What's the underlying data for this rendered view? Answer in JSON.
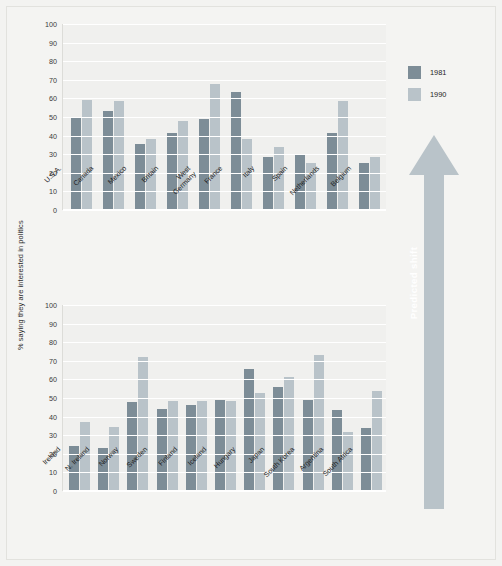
{
  "figure": {
    "ylabel": "% saying they are interested in politics",
    "annotation": "Predicted shift"
  },
  "legend": {
    "position": "top-right",
    "items": [
      {
        "label": "1981",
        "color": "#7d8d97"
      },
      {
        "label": "1990",
        "color": "#b9c3c9"
      }
    ]
  },
  "axis": {
    "ticks": [
      "100",
      "90",
      "80",
      "70",
      "60",
      "50",
      "40",
      "30",
      "20",
      "10",
      "0"
    ]
  },
  "chart_data": [
    {
      "type": "bar",
      "title": "",
      "xlabel": "",
      "ylabel": "% saying they are interested in politics",
      "ylim": [
        0,
        100
      ],
      "grid": true,
      "panel": "top",
      "categories": [
        "U.S.A.",
        "Canada",
        "Mexico",
        "Britain",
        "West\nGermany",
        "France",
        "Italy",
        "Spain",
        "Netherlands",
        "Belgium"
      ],
      "series": [
        {
          "name": "1981",
          "color": "#7d8d97",
          "values": [
            50,
            53,
            35.5,
            41.5,
            49,
            63.5,
            38.5,
            30,
            25.5,
            41.5
          ]
        },
        {
          "name": "1990",
          "color": "#b9c3c9",
          "values": [
            59,
            58.5,
            38,
            48,
            68,
            38,
            28.5,
            34,
            30.5,
            25.5
          ]
        }
      ],
      "bar_order_note": "Within each country group the 1981 bar is drawn left and the 1990 bar right."
    },
    {
      "type": "bar",
      "title": "",
      "xlabel": "",
      "ylabel": "% saying they are interested in politics",
      "ylim": [
        0,
        100
      ],
      "grid": true,
      "panel": "bottom",
      "categories": [
        "Ireland",
        "N. Ireland",
        "Norway",
        "Sweden",
        "Finland",
        "Iceland",
        "Hungary",
        "Japan",
        "South Korea",
        "Argentina",
        "South Africa"
      ],
      "series": [
        {
          "name": "1981",
          "color": "#7d8d97",
          "values": [
            24,
            23,
            48,
            44,
            46,
            49,
            65.5,
            56,
            49,
            43.5,
            34
          ]
        },
        {
          "name": "1990",
          "color": "#b9c3c9",
          "values": [
            37,
            34.5,
            72,
            48.5,
            48.5,
            48.5,
            52.5,
            61.5,
            73,
            31.5,
            54
          ]
        }
      ]
    }
  ],
  "panels": {
    "top": {
      "bars": [
        {
          "category": "U.S.A.",
          "v1981": 50,
          "v1990": 59
        },
        {
          "category": "Canada",
          "v1981": 53,
          "v1990": 58.5
        },
        {
          "category": "Mexico",
          "v1981": 35.5,
          "v1990": 38
        },
        {
          "category": "Britain",
          "v1981": 41.5,
          "v1990": 48
        },
        {
          "category": "West Germany",
          "v1981": 49,
          "v1990": 68
        },
        {
          "category": "France",
          "v1981": 63.5,
          "v1990": 38
        },
        {
          "category": "Italy",
          "v1981": 28.5,
          "v1990": 34
        },
        {
          "category": "Spain",
          "v1981": 30,
          "v1990": 25.5
        },
        {
          "category": "Netherlands",
          "v1981": 41.5,
          "v1990": 58.5
        },
        {
          "category": "Belgium",
          "v1981": 25.5,
          "v1990": 28.5
        }
      ]
    },
    "bottom": {
      "bars": [
        {
          "category": "Ireland",
          "v1981": 24,
          "v1990": 37
        },
        {
          "category": "N. Ireland",
          "v1981": 23,
          "v1990": 34.5
        },
        {
          "category": "Norway",
          "v1981": 48,
          "v1990": 72
        },
        {
          "category": "Sweden",
          "v1981": 44,
          "v1990": 48.5
        },
        {
          "category": "Finland",
          "v1981": 46,
          "v1990": 48.5
        },
        {
          "category": "Iceland",
          "v1981": 49,
          "v1990": 48.5
        },
        {
          "category": "Hungary",
          "v1981": 65.5,
          "v1990": 52.5
        },
        {
          "category": "Japan",
          "v1981": 56,
          "v1990": 61.5
        },
        {
          "category": "South Korea",
          "v1981": 49,
          "v1990": 73
        },
        {
          "category": "Argentina",
          "v1981": 43.5,
          "v1990": 31.5
        },
        {
          "category": "South Africa",
          "v1981": 34,
          "v1990": 54
        }
      ]
    }
  },
  "labels": {
    "top": [
      "U.S.A.",
      "Canada",
      "Mexico",
      "Britain",
      "West Germany",
      "France",
      "Italy",
      "Spain",
      "Netherlands",
      "Belgium"
    ],
    "bottom": [
      "Ireland",
      "N. Ireland",
      "Norway",
      "Sweden",
      "Finland",
      "Iceland",
      "Hungary",
      "Japan",
      "South Korea",
      "Argentina",
      "South Africa"
    ]
  },
  "colors": {
    "series_1981": "#7d8d97",
    "series_1990": "#b9c3c9",
    "arrow": "#b9c3c9",
    "plot_background": "#f0f0ee",
    "page_background": "#f4f4f2",
    "gridline": "#ffffff"
  }
}
